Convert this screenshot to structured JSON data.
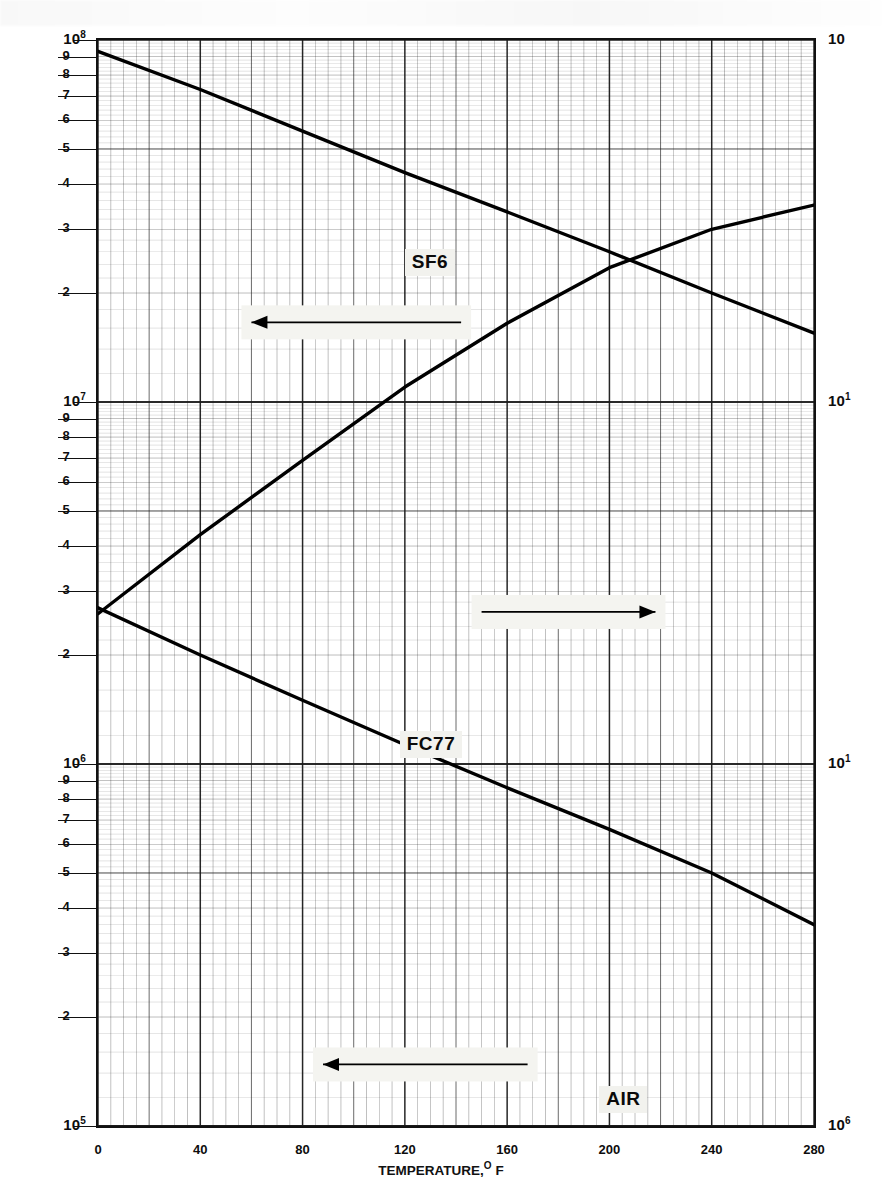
{
  "figure": {
    "domain": "chart",
    "background": "#ffffff",
    "ink_color": "#111111",
    "callout_bg": "#f2f2ee"
  },
  "axes": {
    "x": {
      "title_main": "TEMPERATURE,",
      "title_sup": "O",
      "title_unit": "F",
      "ticks": [
        "0",
        "40",
        "80",
        "120",
        "160",
        "200",
        "240",
        "280"
      ],
      "min": 0,
      "max": 280,
      "minor_step": 5,
      "type": "linear"
    },
    "y_left": {
      "type": "log",
      "min": 100000,
      "max": 100000000,
      "decade_labels": [
        {
          "mantissa": "10",
          "exponent": "8",
          "value": 100000000
        },
        {
          "mantissa": "10",
          "exponent": "7",
          "value": 10000000
        },
        {
          "mantissa": "10",
          "exponent": "6",
          "value": 1000000
        },
        {
          "mantissa": "10",
          "exponent": "5",
          "value": 100000
        }
      ],
      "minor_labels": [
        "9",
        "8",
        "7",
        "6",
        "5",
        "4",
        "3",
        "2"
      ]
    },
    "y_right": {
      "type": "log",
      "min": 1000000,
      "max": 100000000,
      "decade_labels": [
        {
          "mantissa": "10",
          "exponent": "",
          "value": 100000000
        },
        {
          "mantissa": "10",
          "exponent": "1",
          "value": 10000000
        },
        {
          "mantissa": "10",
          "exponent": "1",
          "value": 1000000
        },
        {
          "mantissa": "10",
          "exponent": "6",
          "value": 100000
        }
      ]
    }
  },
  "chart_data": {
    "type": "line",
    "title": "",
    "xlabel": "TEMPERATURE, O F",
    "ylabel": "",
    "xlim": [
      0,
      280
    ],
    "grid": true,
    "log_y": true,
    "legend": "inline-callout",
    "series": [
      {
        "name": "SF6",
        "axis": "left",
        "arrow": "left",
        "label_x": 120,
        "label_y_decades": 0.62,
        "points": [
          {
            "x": 0,
            "y": 93000000
          },
          {
            "x": 40,
            "y": 73000000
          },
          {
            "x": 80,
            "y": 56000000
          },
          {
            "x": 120,
            "y": 43000000
          },
          {
            "x": 160,
            "y": 33500000
          },
          {
            "x": 200,
            "y": 26000000
          },
          {
            "x": 240,
            "y": 20000000
          },
          {
            "x": 280,
            "y": 15500000
          }
        ]
      },
      {
        "name": "FC77",
        "axis": "right",
        "arrow": "right",
        "label_x": 118,
        "label_y_decades": 1.95,
        "points": [
          {
            "x": 0,
            "y": 2600000
          },
          {
            "x": 40,
            "y": 4300000
          },
          {
            "x": 80,
            "y": 6900000
          },
          {
            "x": 120,
            "y": 11000000
          },
          {
            "x": 160,
            "y": 16500000
          },
          {
            "x": 200,
            "y": 23500000
          },
          {
            "x": 240,
            "y": 30000000
          },
          {
            "x": 280,
            "y": 35000000
          }
        ]
      },
      {
        "name": "AIR",
        "axis": "left",
        "arrow": "left",
        "label_x": 196,
        "label_y_decades": 2.93,
        "points": [
          {
            "x": 0,
            "y": 2700000
          },
          {
            "x": 40,
            "y": 2000000
          },
          {
            "x": 80,
            "y": 1500000
          },
          {
            "x": 120,
            "y": 1130000
          },
          {
            "x": 160,
            "y": 860000
          },
          {
            "x": 200,
            "y": 660000
          },
          {
            "x": 240,
            "y": 500000
          },
          {
            "x": 280,
            "y": 360000
          }
        ]
      }
    ],
    "annotations": [
      {
        "kind": "arrow",
        "series": "SF6",
        "direction": "left",
        "x_from": 142,
        "x_to": 60,
        "y_decades": 0.78
      },
      {
        "kind": "arrow",
        "series": "FC77",
        "direction": "right",
        "x_from": 150,
        "x_to": 218,
        "y_decades": 1.58
      },
      {
        "kind": "arrow",
        "series": "AIR",
        "direction": "left",
        "x_from": 168,
        "x_to": 88,
        "y_decades": 2.83
      }
    ]
  }
}
